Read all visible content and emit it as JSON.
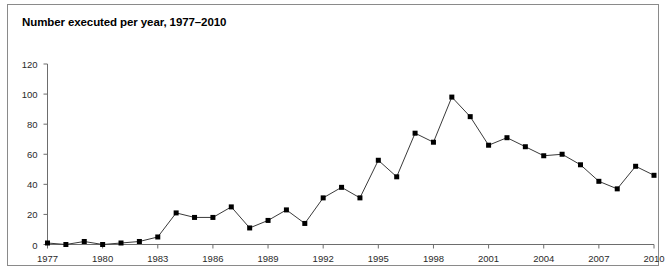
{
  "figure": {
    "title": "Number executed per year, 1977–2010",
    "border_color": "#8a8a8a",
    "background": "#ffffff"
  },
  "chart_data": {
    "type": "line",
    "title": "Number executed per year, 1977–2010",
    "xlabel": "",
    "ylabel": "",
    "grid": false,
    "legend": null,
    "marker": "square",
    "marker_color": "#000000",
    "line_color": "#3a3a3a",
    "xlim": [
      1977,
      2010
    ],
    "ylim": [
      0,
      120
    ],
    "yticks": [
      0,
      20,
      40,
      60,
      80,
      100,
      120
    ],
    "ytick_labels": [
      "0",
      "20",
      "40",
      "60",
      "80",
      "100",
      "120"
    ],
    "xticks": [
      1977,
      1980,
      1983,
      1986,
      1989,
      1992,
      1995,
      1998,
      2001,
      2004,
      2007,
      2010
    ],
    "xtick_labels": [
      "1977",
      "1980",
      "1983",
      "1986",
      "1989",
      "1992",
      "1995",
      "1998",
      "2001",
      "2004",
      "2007",
      "2010"
    ],
    "x": [
      1977,
      1978,
      1979,
      1980,
      1981,
      1982,
      1983,
      1984,
      1985,
      1986,
      1987,
      1988,
      1989,
      1990,
      1991,
      1992,
      1993,
      1994,
      1995,
      1996,
      1997,
      1998,
      1999,
      2000,
      2001,
      2002,
      2003,
      2004,
      2005,
      2006,
      2007,
      2008,
      2009,
      2010
    ],
    "values": [
      1,
      0,
      2,
      0,
      1,
      2,
      5,
      21,
      18,
      18,
      25,
      11,
      16,
      23,
      14,
      31,
      38,
      31,
      56,
      45,
      74,
      68,
      98,
      85,
      66,
      71,
      65,
      59,
      60,
      53,
      42,
      37,
      52,
      46
    ]
  }
}
